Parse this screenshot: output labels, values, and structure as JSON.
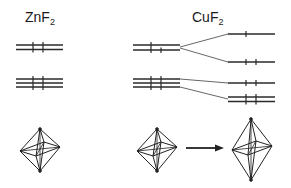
{
  "diagram": {
    "type": "crystal-field-splitting",
    "labels": {
      "left": {
        "base": "ZnF",
        "sub": "2"
      },
      "right": {
        "base": "CuF",
        "sub": "2"
      }
    },
    "colors": {
      "line": "#2a2a2a",
      "connector": "#555555",
      "background": "#ffffff"
    },
    "levels": {
      "znf2_eg": {
        "lines": 2,
        "electrons": "d10 upper pair, fully paired"
      },
      "znf2_t2g": {
        "lines": 3,
        "electrons": "fully paired"
      },
      "cuf2_left_eg": {
        "lines": 2,
        "electrons": "3 electrons"
      },
      "cuf2_left_t2g": {
        "lines": 3,
        "electrons": "fully paired"
      },
      "cuf2_split": [
        "dx2-y2 (1 electron)",
        "dz2 (2 electrons)",
        "dxy (2 electrons)",
        "dxz/dyz (4 electrons)"
      ]
    },
    "octahedra": [
      "regular (ZnF2)",
      "regular (CuF2 before distortion)",
      "elongated (Jahn-Teller distorted CuF2)"
    ],
    "arrow": "distortion direction"
  }
}
